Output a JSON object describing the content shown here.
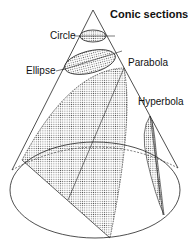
{
  "diagram": {
    "title": "Conic sections",
    "labels": {
      "circle": "Circle",
      "ellipse": "Ellipse",
      "parabola": "Parabola",
      "hyperbola": "Hyperbola"
    },
    "colors": {
      "stroke": "#222222",
      "fill_dots": "#555555",
      "background": "#ffffff"
    }
  }
}
